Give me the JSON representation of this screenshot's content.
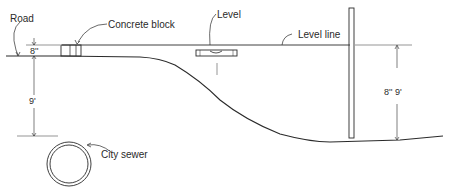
{
  "diagram": {
    "labels": {
      "road": "Road",
      "concrete_block": "Concrete block",
      "level": "Level",
      "level_line": "Level line",
      "city_sewer": "City sewer"
    },
    "dimensions": {
      "block_height": "8''",
      "road_to_sewer": "9'",
      "level_line_to_ground": "8'' 9'"
    }
  }
}
